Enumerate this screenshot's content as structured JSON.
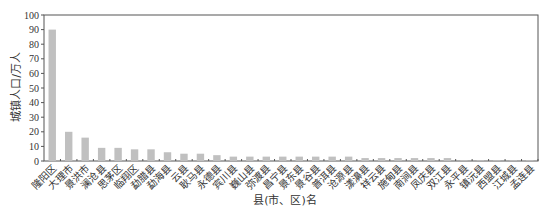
{
  "chart_data": {
    "type": "bar",
    "title": "",
    "xlabel": "县(市、区)名",
    "ylabel": "城镇人口/万人",
    "ylim": [
      0,
      100
    ],
    "yticks": [
      0,
      10,
      20,
      30,
      40,
      50,
      60,
      70,
      80,
      90,
      100
    ],
    "grid": false,
    "legend": null,
    "bar_color": "#c0c0c0",
    "categories": [
      "隆阳区",
      "大理市",
      "景洪市",
      "澜沧县",
      "思茅区",
      "临翔区",
      "勐腊县",
      "勐海县",
      "云县",
      "耿马县",
      "永德县",
      "宾川县",
      "巍山县",
      "弥渡县",
      "昌宁县",
      "景东县",
      "景谷县",
      "普洱县",
      "沧源县",
      "漾濞县",
      "祥云县",
      "施甸县",
      "南涧县",
      "凤庆县",
      "双江县",
      "永平县",
      "镇沅县",
      "西盟县",
      "江城县",
      "孟连县"
    ],
    "values": [
      90,
      20,
      16,
      9,
      9,
      8,
      8,
      6,
      5,
      5,
      4,
      3,
      3,
      3,
      3,
      3,
      3,
      3,
      3,
      2,
      2,
      2,
      2,
      2,
      2,
      0.5,
      0.5,
      0.5,
      0.5,
      0.5
    ]
  }
}
